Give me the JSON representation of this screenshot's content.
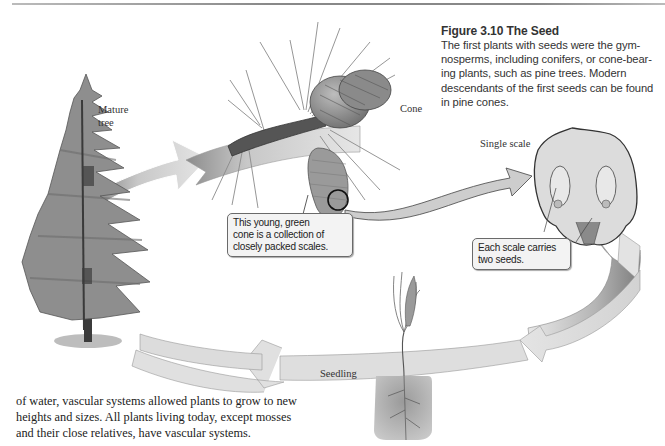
{
  "figure": {
    "title": "Figure 3.10  The Seed",
    "caption": "The first plants with seeds were the gymnosperms, including conifers, or cone-bearing plants, such as pine trees. Modern descendants of the first seeds can be found in pine cones.",
    "caption_lines": [
      "The first plants with seeds were the gym-",
      "nosperms, including conifers, or cone-bear-",
      "ing plants, such as pine trees. Modern",
      "descendants of the first seeds can be found",
      "in pine cones."
    ]
  },
  "labels": {
    "mature_tree_line1": "Mature",
    "mature_tree_line2": "tree",
    "cone": "Cone",
    "single_scale": "Single scale",
    "seedling": "Seedling"
  },
  "callouts": {
    "young_cone": [
      "This young, green",
      "cone is a collection of",
      "closely packed scales."
    ],
    "scale_seeds": [
      "Each scale carries",
      "two seeds."
    ]
  },
  "body_text": {
    "lines": [
      "of water, vascular systems allowed plants to grow to new",
      "heights and sizes. All plants living today, except mosses",
      "and their close relatives, have vascular systems."
    ]
  },
  "icons": [
    "pine-tree-illustration",
    "pine-cone-illustration",
    "young-cone-illustration",
    "scale-illustration",
    "seedling-illustration",
    "cycle-arrow"
  ],
  "colors": {
    "arrow_fill": "#d6d6d6",
    "arrow_dark": "#9a9a9a",
    "text": "#222222",
    "callout_bg": "#f3f3f3"
  }
}
